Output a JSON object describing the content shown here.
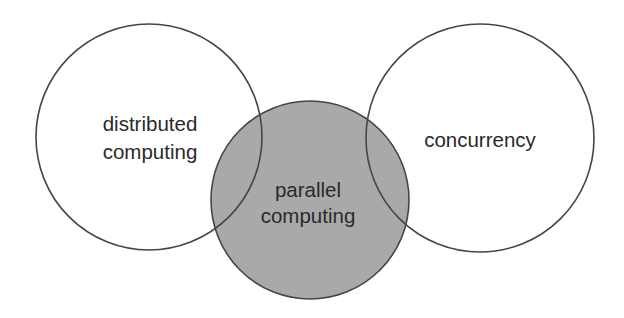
{
  "diagram": {
    "type": "venn",
    "colors": {
      "background": "#ffffff",
      "stroke": "#454545",
      "highlight_fill": "#a9a9a9",
      "text": "#2a2a2a"
    },
    "circles": [
      {
        "id": "distributed-computing",
        "label_lines": [
          "distributed",
          "computing"
        ],
        "cx": 149,
        "cy": 137,
        "r": 113,
        "filled": false
      },
      {
        "id": "parallel-computing",
        "label_lines": [
          "parallel",
          "computing"
        ],
        "cx": 310,
        "cy": 200,
        "r": 99,
        "filled": true
      },
      {
        "id": "concurrency",
        "label_lines": [
          "concurrency"
        ],
        "cx": 480,
        "cy": 138,
        "r": 114,
        "filled": false
      }
    ]
  }
}
